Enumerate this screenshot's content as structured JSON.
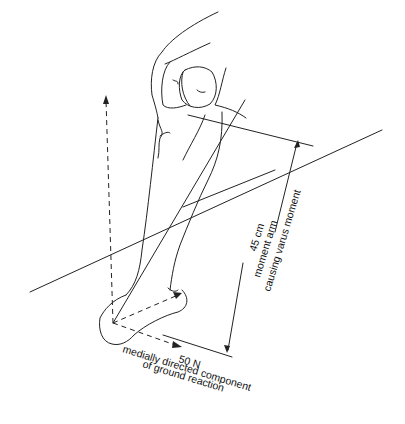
{
  "figure": {
    "type": "anatomical line drawing",
    "ink_color": "#222222",
    "background": "#ffffff"
  },
  "labels": {
    "force_value": "50 N",
    "force_line1": "medially directed component",
    "force_line2": "of ground reaction",
    "arm_value": "45 cm",
    "arm_line1": "moment arm",
    "arm_line2": "causing varus moment"
  }
}
